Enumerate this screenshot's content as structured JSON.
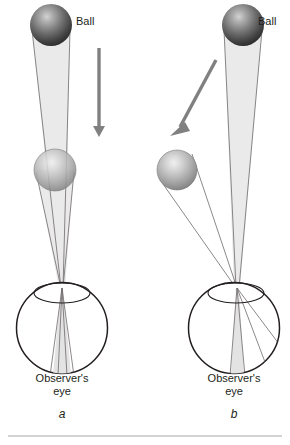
{
  "figure": {
    "background_color": "#ffffff",
    "width": 290,
    "height": 445,
    "bottom_rule": {
      "color": "#a7a7a7",
      "y": 436,
      "x_start": 8,
      "x_end": 282
    }
  },
  "panels": [
    {
      "id": "a",
      "letter": "a",
      "ball_label": "Ball",
      "caption_line1": "Observer's",
      "caption_line2": "eye",
      "description": "Ball falls straight down along the line of sight; image stays centered on the fovea",
      "ball_top": {
        "cx": 51,
        "cy": 25,
        "r": 21,
        "shade": "dark"
      },
      "ball_lower": {
        "cx": 55,
        "cy": 170,
        "r": 21,
        "shade": "light"
      },
      "arrow": {
        "x1": 99,
        "y1": 48,
        "x2": 99,
        "y2": 136,
        "direction": "down",
        "color": "#808080"
      },
      "eye": {
        "cx": 62,
        "cy": 328,
        "r": 46,
        "nodal_x": 62,
        "nodal_y": 288
      }
    },
    {
      "id": "b",
      "letter": "b",
      "ball_label": "Ball",
      "caption_line1": "Observer's",
      "caption_line2": "eye",
      "description": "Ball falls diagonally; image moves across the retina away from the fovea",
      "ball_top": {
        "cx": 243,
        "cy": 25,
        "r": 21,
        "shade": "dark"
      },
      "ball_lower": {
        "cx": 177,
        "cy": 170,
        "r": 20,
        "shade": "light"
      },
      "arrow": {
        "x1": 216,
        "y1": 60,
        "x2": 175,
        "y2": 136,
        "direction": "down-left",
        "color": "#808080"
      },
      "eye": {
        "cx": 234,
        "cy": 328,
        "r": 46,
        "nodal_x": 237,
        "nodal_y": 288
      }
    }
  ],
  "colors": {
    "outline": "#231f20",
    "text": "#231f20",
    "arrow": "#808080",
    "light_cone": "#e8e8e8",
    "ray_line": "#6e6a6b",
    "rule": "#a7a7a7",
    "ball_dark_center": "#b9b9b9",
    "ball_dark_edge": "#3a3a3a",
    "ball_light_center": "#e4e4e4",
    "ball_light_edge": "#767676"
  }
}
